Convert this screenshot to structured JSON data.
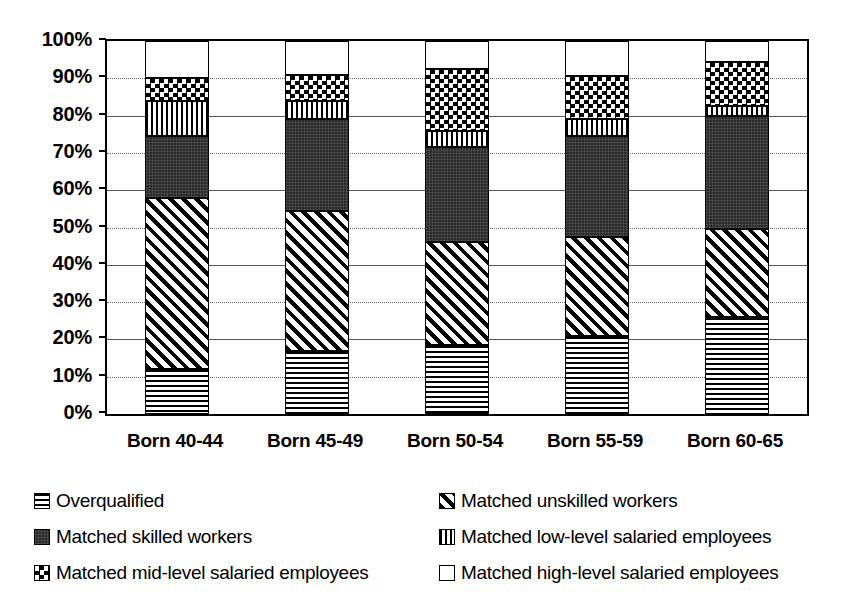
{
  "chart_data": {
    "type": "bar",
    "stacked": true,
    "title": "",
    "subtitle": "",
    "xlabel": "",
    "ylabel": "",
    "ylim": [
      0,
      100
    ],
    "yunit": "%",
    "grid": true,
    "legend_position": "bottom",
    "categories": [
      "Born 40-44",
      "Born 45-49",
      "Born 50-54",
      "Born 55-59",
      "Born 60-65"
    ],
    "ytick_labels": [
      "100%",
      "90%",
      "80%",
      "70%",
      "60%",
      "50%",
      "40%",
      "30%",
      "20%",
      "10%",
      "0%"
    ],
    "ytick_values": [
      100,
      90,
      80,
      70,
      60,
      50,
      40,
      30,
      20,
      10,
      0
    ],
    "series": [
      {
        "name": "Overqualified",
        "pattern": "horizontal-lines",
        "values": [
          12,
          17,
          18.5,
          21,
          26
        ]
      },
      {
        "name": "Matched unskilled workers",
        "pattern": "diagonal-hatch",
        "values": [
          46,
          37.5,
          27.5,
          26.5,
          23.5
        ]
      },
      {
        "name": "Matched skilled workers",
        "pattern": "solid-dark",
        "values": [
          16.5,
          24.5,
          25.5,
          27,
          30.5
        ]
      },
      {
        "name": "Matched low-level salaried employees",
        "pattern": "vertical-lines",
        "values": [
          9.5,
          5,
          4.5,
          4.5,
          2.5
        ]
      },
      {
        "name": "Matched mid-level salaried employees",
        "pattern": "checkerboard",
        "values": [
          6,
          7,
          16.5,
          11.5,
          12
        ]
      },
      {
        "name": "Matched high-level salaried employees",
        "pattern": "empty-white",
        "values": [
          10,
          9,
          7.5,
          9.5,
          5.5
        ]
      }
    ],
    "cumulative_tops": [
      [
        12,
        58,
        74.5,
        84,
        90,
        100
      ],
      [
        17,
        54.5,
        79,
        84,
        91,
        100
      ],
      [
        18.5,
        46,
        71.5,
        76,
        92.5,
        100
      ],
      [
        21,
        47.5,
        74.5,
        79,
        90.5,
        100
      ],
      [
        26,
        49.5,
        80,
        82.5,
        94.5,
        100
      ]
    ]
  },
  "legend": {
    "rows": [
      {
        "left": {
          "label": "Overqualified",
          "pattern": "horizontal-lines"
        },
        "right": {
          "label": "Matched unskilled workers",
          "pattern": "diagonal-hatch"
        }
      },
      {
        "left": {
          "label": "Matched skilled workers",
          "pattern": "solid-dark"
        },
        "right": {
          "label": "Matched low-level salaried employees",
          "pattern": "vertical-lines"
        }
      },
      {
        "left": {
          "label": "Matched mid-level salaried employees",
          "pattern": "checkerboard"
        },
        "right": {
          "label": "Matched high-level salaried employees",
          "pattern": "empty-white"
        }
      }
    ]
  },
  "colors": {
    "axis": "#000000",
    "grid": "#5a5a5a",
    "background": "#ffffff",
    "dark_fill": "#2a2a2a"
  }
}
